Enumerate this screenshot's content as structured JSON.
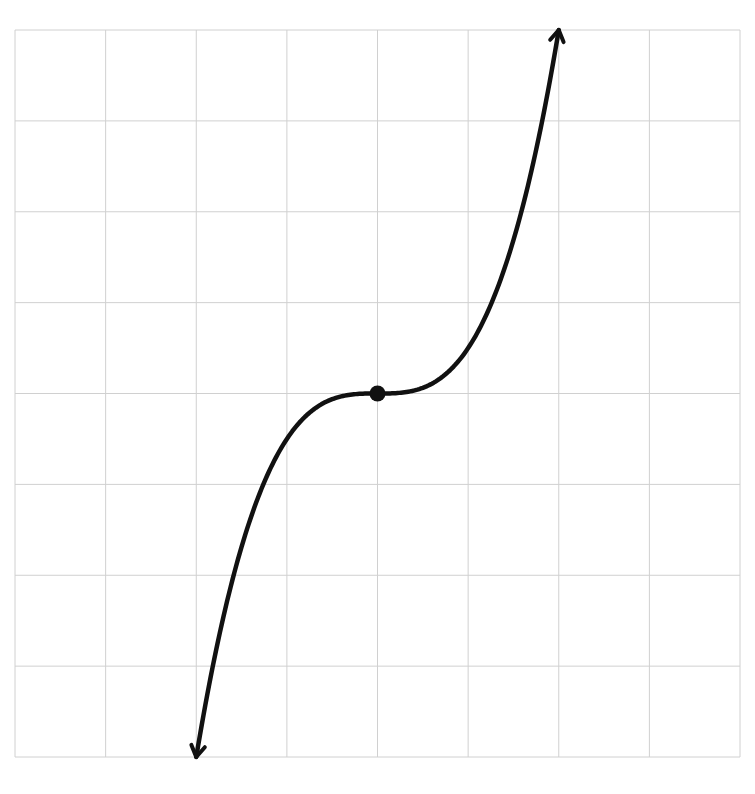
{
  "chart_data": {
    "type": "line",
    "title": "",
    "xlabel": "",
    "ylabel": "",
    "function": "y = 0.5 * x^3",
    "xlim": [
      -4,
      4
    ],
    "ylim": [
      -4,
      4
    ],
    "grid": true,
    "grid_cells": {
      "cols": 8,
      "rows": 8
    },
    "axis_labels_shown": false,
    "tick_labels_shown": false,
    "series": [
      {
        "name": "cubic",
        "x": [
          -2.0,
          -1.75,
          -1.5,
          -1.25,
          -1.0,
          -0.75,
          -0.5,
          -0.25,
          0,
          0.25,
          0.5,
          0.75,
          1.0,
          1.25,
          1.5,
          1.75,
          2.0
        ],
        "y": [
          -4.0,
          -2.68,
          -1.69,
          -0.98,
          -0.5,
          -0.21,
          -0.06,
          -0.01,
          0,
          0.01,
          0.06,
          0.21,
          0.5,
          0.98,
          1.69,
          2.68,
          4.0
        ],
        "arrows_at_ends": true,
        "color": "#111111"
      }
    ],
    "points": [
      {
        "label": "inflection point",
        "x": 0,
        "y": 0,
        "filled": true
      }
    ]
  },
  "style": {
    "grid_color": "#d0d0d0",
    "curve_color": "#111111",
    "background": "#ffffff"
  }
}
